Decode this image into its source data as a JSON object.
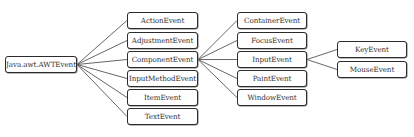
{
  "diagram": {
    "title_fragment": "Java event handling types",
    "root": {
      "label": "Java.awt.AWTEvent"
    },
    "level1": [
      {
        "label": "ActionEvent"
      },
      {
        "label": "AdjustmentEvent"
      },
      {
        "label": "ComponentEvent"
      },
      {
        "label": "InputMethodEvent"
      },
      {
        "label": "ItemEvent"
      },
      {
        "label": "TextEvent"
      }
    ],
    "level2_component": [
      {
        "label": "ContainerEvent"
      },
      {
        "label": "FocusEvent"
      },
      {
        "label": "InputEvent"
      },
      {
        "label": "PaintEvent"
      },
      {
        "label": "WindowEvent"
      }
    ],
    "level3_input": [
      {
        "label": "KeyEvent"
      },
      {
        "label": "MouseEvent"
      }
    ],
    "colors": {
      "border": "#2b2b2b",
      "line": "#555555",
      "text": "#333333"
    }
  }
}
